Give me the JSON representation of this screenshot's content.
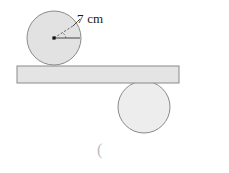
{
  "figure": {
    "background_color": "#ffffff",
    "radius_label": "7 cm",
    "stray_mark": "(",
    "colors": {
      "circle_fill_top": "#e2e2e2",
      "circle_fill_bottom": "#ededed",
      "circle_stroke": "#8a8a8a",
      "bar_fill": "#e4e4e4",
      "bar_stroke": "#8a8a8a",
      "line_color": "#333333",
      "dash_color": "#555555",
      "text_color": "#1a1a1a",
      "faint_text_color": "#bdbdbd"
    },
    "top_circle": {
      "name": "upper-circle",
      "center_x": 54,
      "center_y": 38,
      "radius": 27,
      "radius_value": 7,
      "radius_unit": "cm"
    },
    "bottom_circle": {
      "name": "lower-circle",
      "center_x": 144,
      "center_y": 107,
      "radius": 26
    },
    "bar": {
      "name": "horizontal-plank",
      "x": 17,
      "y": 66,
      "width": 162,
      "height": 17
    },
    "center_dot": {
      "x": 54,
      "y": 38,
      "size": 3.2
    },
    "radius_line": {
      "from_x": 54,
      "from_y": 38,
      "to_x": 80,
      "to_y": 38
    },
    "angle_dashed_line": {
      "from_x": 54,
      "from_y": 38,
      "to_x": 73,
      "to_y": 26
    },
    "dashed_arc": {
      "from_x": 66,
      "from_y": 38,
      "to_x": 62,
      "to_y": 32
    },
    "leader_line": {
      "from_x": 73,
      "from_y": 26,
      "to_x": 80,
      "to_y": 19
    }
  }
}
